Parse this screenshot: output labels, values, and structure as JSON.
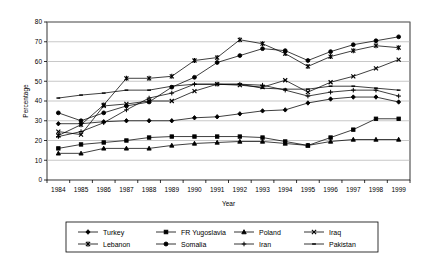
{
  "chart_data": {
    "type": "line",
    "title": "",
    "xlabel": "Year",
    "ylabel": "Percentage",
    "xlim": [
      1984,
      1999
    ],
    "ylim": [
      0,
      80
    ],
    "ytick_step": 10,
    "yticks": [
      0,
      10,
      20,
      30,
      40,
      50,
      60,
      70,
      80
    ],
    "grid": "horizontal",
    "legend_position": "bottom",
    "x": [
      1984,
      1985,
      1986,
      1987,
      1988,
      1989,
      1990,
      1991,
      1992,
      1993,
      1994,
      1995,
      1996,
      1997,
      1998,
      1999
    ],
    "categories": [
      "1984",
      "1985",
      "1986",
      "1987",
      "1988",
      "1989",
      "1990",
      "1991",
      "1992",
      "1993",
      "1994",
      "1995",
      "1996",
      "1997",
      "1998",
      "1999"
    ],
    "series": [
      {
        "name": "Turkey",
        "marker": "diamond",
        "values": [
          28.5,
          28.5,
          29.5,
          30.0,
          30.0,
          30.0,
          31.5,
          32.0,
          33.5,
          35.0,
          35.5,
          39.0,
          41.0,
          42.0,
          42.0,
          39.5
        ]
      },
      {
        "name": "FR Yugoslavia",
        "marker": "square",
        "values": [
          16.0,
          18.0,
          19.0,
          20.0,
          21.5,
          22.0,
          22.0,
          22.0,
          22.0,
          21.5,
          19.5,
          17.5,
          21.5,
          25.5,
          31.0,
          31.0
        ]
      },
      {
        "name": "Poland",
        "marker": "triangle",
        "values": [
          13.5,
          13.5,
          16.0,
          16.0,
          16.0,
          17.5,
          18.5,
          19.0,
          19.5,
          19.5,
          18.5,
          17.5,
          19.5,
          20.5,
          20.5,
          20.5
        ]
      },
      {
        "name": "Iraq",
        "marker": "cross",
        "values": [
          24.5,
          23.0,
          37.5,
          38.5,
          40.0,
          40.0,
          45.0,
          48.5,
          48.0,
          47.0,
          50.5,
          44.5,
          49.5,
          52.5,
          56.5,
          61.0
        ]
      },
      {
        "name": "Lebanon",
        "marker": "asterisk",
        "values": [
          22.5,
          28.0,
          38.0,
          51.5,
          51.5,
          52.5,
          60.5,
          62.0,
          71.0,
          69.0,
          64.0,
          57.5,
          62.5,
          65.5,
          68.0,
          67.0
        ]
      },
      {
        "name": "Somalia",
        "marker": "circle",
        "values": [
          34.0,
          30.0,
          34.0,
          37.5,
          39.5,
          47.0,
          52.0,
          59.5,
          63.0,
          66.5,
          65.5,
          60.5,
          65.0,
          68.5,
          70.5,
          72.5
        ]
      },
      {
        "name": "Iran",
        "marker": "plus",
        "values": [
          22.0,
          24.5,
          29.0,
          35.5,
          41.5,
          44.0,
          48.5,
          48.5,
          48.5,
          48.0,
          45.5,
          42.5,
          44.5,
          45.5,
          45.5,
          42.5
        ]
      },
      {
        "name": "Pakistan",
        "marker": "dash",
        "values": [
          41.5,
          43.0,
          44.0,
          45.5,
          45.5,
          47.5,
          48.5,
          48.5,
          48.5,
          46.5,
          46.0,
          46.0,
          47.5,
          47.5,
          46.5,
          45.5
        ]
      }
    ]
  }
}
